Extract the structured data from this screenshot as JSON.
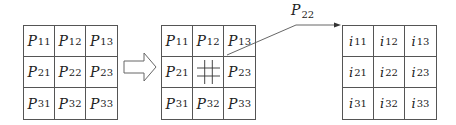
{
  "diagram": {
    "input_matrix": {
      "symbol": "P",
      "cells": [
        [
          {
            "sym": "P",
            "idx": "11"
          },
          {
            "sym": "P",
            "idx": "12"
          },
          {
            "sym": "P",
            "idx": "13"
          }
        ],
        [
          {
            "sym": "P",
            "idx": "21"
          },
          {
            "sym": "P",
            "idx": "22"
          },
          {
            "sym": "P",
            "idx": "23"
          }
        ],
        [
          {
            "sym": "P",
            "idx": "31"
          },
          {
            "sym": "P",
            "idx": "32"
          },
          {
            "sym": "P",
            "idx": "33"
          }
        ]
      ]
    },
    "transition_arrow": "hollow-right-arrow",
    "subdivided_matrix": {
      "cells": [
        [
          {
            "sym": "P",
            "idx": "11"
          },
          {
            "sym": "P",
            "idx": "12"
          },
          {
            "sym": "P",
            "idx": "13"
          }
        ],
        [
          {
            "sym": "P",
            "idx": "21"
          },
          {
            "sym": "",
            "idx": "",
            "subgrid": "3x3"
          },
          {
            "sym": "P",
            "idx": "23"
          }
        ],
        [
          {
            "sym": "P",
            "idx": "31"
          },
          {
            "sym": "P",
            "idx": "32"
          },
          {
            "sym": "P",
            "idx": "33"
          }
        ]
      ],
      "highlighted_cell": "center-subdivided-3x3"
    },
    "callout": {
      "sym": "P",
      "idx": "22"
    },
    "output_matrix": {
      "symbol": "i",
      "cells": [
        [
          {
            "sym": "i",
            "idx": "11"
          },
          {
            "sym": "i",
            "idx": "12"
          },
          {
            "sym": "i",
            "idx": "13"
          }
        ],
        [
          {
            "sym": "i",
            "idx": "21"
          },
          {
            "sym": "i",
            "idx": "22"
          },
          {
            "sym": "i",
            "idx": "23"
          }
        ],
        [
          {
            "sym": "i",
            "idx": "31"
          },
          {
            "sym": "i",
            "idx": "32"
          },
          {
            "sym": "i",
            "idx": "33"
          }
        ]
      ]
    }
  }
}
